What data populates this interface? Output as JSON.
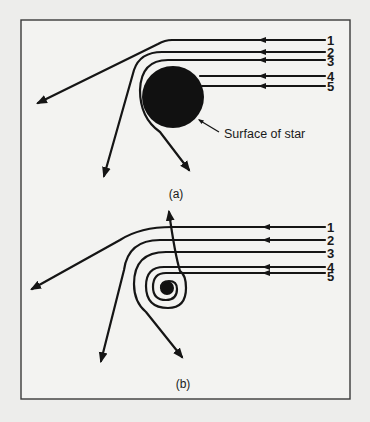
{
  "figure": {
    "panels": [
      {
        "id": "a",
        "caption": "(a)",
        "object": "star",
        "annotation": "Surface of star",
        "rays": [
          {
            "label": "1",
            "outcome": "deflected slightly"
          },
          {
            "label": "2",
            "outcome": "deflected strongly"
          },
          {
            "label": "3",
            "outcome": "grazes surface, deflected"
          },
          {
            "label": "4",
            "outcome": "hits star"
          },
          {
            "label": "5",
            "outcome": "hits star"
          }
        ]
      },
      {
        "id": "b",
        "caption": "(b)",
        "object": "collapsed star / black hole",
        "annotation": "",
        "rays": [
          {
            "label": "1",
            "outcome": "deflected slightly"
          },
          {
            "label": "2",
            "outcome": "deflected strongly"
          },
          {
            "label": "3",
            "outcome": "loops around and escapes"
          },
          {
            "label": "4",
            "outcome": "spirals in"
          },
          {
            "label": "5",
            "outcome": "spirals in"
          }
        ]
      }
    ],
    "colors": {
      "ink": "#151515",
      "paper": "#f3f3f1",
      "frame": "#3a3a3a"
    }
  }
}
